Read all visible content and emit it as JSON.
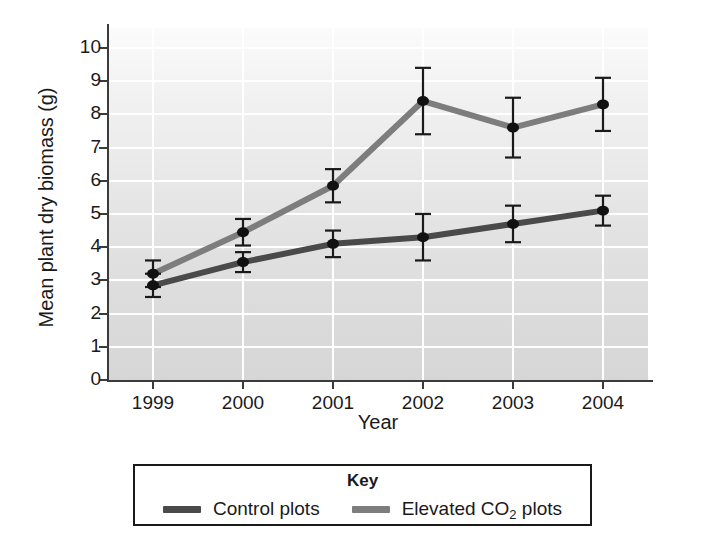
{
  "chart_data": {
    "type": "line",
    "title": "",
    "xlabel": "Year",
    "ylabel": "Mean plant dry biomass (g)",
    "categories": [
      "1999",
      "2000",
      "2001",
      "2002",
      "2003",
      "2004"
    ],
    "x": [
      1999,
      2000,
      2001,
      2002,
      2003,
      2004
    ],
    "ylim": [
      0,
      10.6
    ],
    "xlim": [
      1998.6,
      2004.4
    ],
    "yticks": [
      0,
      1,
      2,
      3,
      4,
      5,
      6,
      7,
      8,
      9,
      10
    ],
    "ytick_labels": [
      "0",
      "1",
      "2",
      "3",
      "4",
      "5",
      "6",
      "7",
      "8",
      "9",
      "10"
    ],
    "grid": "horizontal-and-vertical-white-gridlines",
    "legend_position": "below-plot",
    "legend_title": "Key",
    "error_bars": "standard-error, symmetric, capped",
    "series": [
      {
        "name": "Control plots",
        "color": "#4a4a4a",
        "values": [
          2.85,
          3.55,
          4.1,
          4.3,
          4.7,
          5.1
        ],
        "errors": [
          0.35,
          0.3,
          0.4,
          0.7,
          0.55,
          0.45
        ]
      },
      {
        "name": "Elevated CO2 plots",
        "color": "#7d7d7d",
        "values": [
          3.2,
          4.45,
          5.85,
          8.4,
          7.6,
          8.3
        ],
        "errors": [
          0.4,
          0.4,
          0.5,
          1.0,
          0.9,
          0.8
        ]
      }
    ]
  },
  "legend": {
    "title": "Key",
    "items": [
      {
        "label_prefix": "Control plots",
        "label_sub": "",
        "label_suffix": "",
        "color": "#4a4a4a"
      },
      {
        "label_prefix": "Elevated CO",
        "label_sub": "2",
        "label_suffix": " plots",
        "color": "#7d7d7d"
      }
    ]
  },
  "axes": {
    "y_title": "Mean plant dry biomass (g)",
    "x_title": "Year"
  },
  "colors": {
    "control_line": "#4a4a4a",
    "elevated_line": "#7d7d7d",
    "marker": "#111111",
    "plot_background_top": "#fbfbfb",
    "plot_background_bottom": "#d6d6d6",
    "gridline": "#ffffff",
    "axis": "#3b3b3b"
  }
}
